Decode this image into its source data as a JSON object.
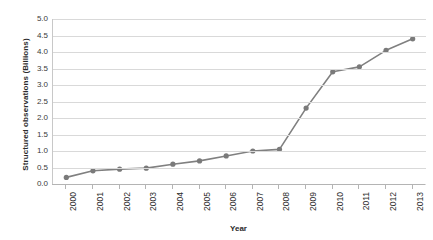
{
  "chart_data": {
    "type": "line",
    "title": "",
    "xlabel": "Year",
    "ylabel": "Structured observations (Billions)",
    "categories": [
      "2000",
      "2001",
      "2002",
      "2003",
      "2004",
      "2005",
      "2006",
      "2007",
      "2008",
      "2009",
      "2010",
      "2011",
      "2012",
      "2013"
    ],
    "values": [
      0.2,
      0.4,
      0.45,
      0.48,
      0.6,
      0.7,
      0.85,
      1.0,
      1.05,
      2.3,
      3.4,
      3.55,
      4.05,
      4.4
    ],
    "series": [
      {
        "name": "Structured observations",
        "values": [
          0.2,
          0.4,
          0.45,
          0.48,
          0.6,
          0.7,
          0.85,
          1.0,
          1.05,
          2.3,
          3.4,
          3.55,
          4.05,
          4.4
        ]
      }
    ],
    "ylim": [
      0.0,
      5.0
    ],
    "ytick_step": 0.5,
    "yticks": [
      "5.0",
      "4.5",
      "4.0",
      "3.5",
      "3.0",
      "2.5",
      "2.0",
      "1.5",
      "1.0",
      "0.5",
      "0.0"
    ],
    "grid": "horizontal",
    "legend": "none",
    "line_color": "#808080",
    "marker_color": "#7a7a7a",
    "gridline_color": "#d9d9d9",
    "background": "#ffffff"
  }
}
